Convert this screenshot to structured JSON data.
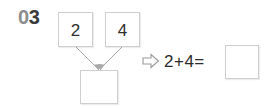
{
  "problem": {
    "number_prefix": "0",
    "number_value": "3",
    "number_full": "03"
  },
  "number_bond": {
    "addend_1": {
      "value": "2",
      "name": "addend-box-1"
    },
    "addend_2": {
      "value": "4",
      "name": "addend-box-2"
    },
    "sum": {
      "value": "",
      "name": "sum-box",
      "state": "empty"
    },
    "arrow_icons": [
      "arrow-down-left-icon",
      "arrow-down-right-icon"
    ]
  },
  "equation": {
    "result_arrow_icon": "hollow-right-arrow-icon",
    "expression": "2+4=",
    "answer": {
      "value": "",
      "state": "empty"
    }
  },
  "colors": {
    "background": "#ffffff",
    "box_border": "#cfcfcf",
    "digit_text": "#2e2e2e",
    "number_zero": "#8d8d8d",
    "number_rest": "#3a3a3a",
    "arrow_stroke": "#a9a9a9"
  }
}
